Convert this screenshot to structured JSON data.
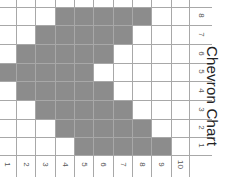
{
  "chart_data": {
    "type": "heatmap",
    "title": "Chevron Chart",
    "orientation_note": "image rotated 90deg clockwise",
    "columns": [
      "1",
      "2",
      "3",
      "4",
      "5",
      "6",
      "7",
      "8",
      "9",
      "10"
    ],
    "rows": [
      "8",
      "7",
      "6",
      "5",
      "4",
      "3",
      "2",
      "1"
    ],
    "filled": {
      "8": [
        4,
        5,
        6,
        7,
        8
      ],
      "7": [
        3,
        4,
        5,
        6,
        7
      ],
      "6": [
        2,
        3,
        4,
        5,
        6
      ],
      "5": [
        1,
        2,
        3,
        4,
        5
      ],
      "4": [
        2,
        3,
        4,
        5,
        6
      ],
      "3": [
        3,
        4,
        5,
        6,
        7
      ],
      "2": [
        4,
        5,
        6,
        7,
        8
      ],
      "1": [
        5,
        6,
        7,
        8,
        9
      ]
    },
    "fill_color": "#8c8c8c",
    "empty_color": "#ffffff",
    "grid": true
  },
  "title": "Chevron Chart",
  "column_labels": [
    "1",
    "2",
    "3",
    "4",
    "5",
    "6",
    "7",
    "8",
    "9",
    "10"
  ],
  "row_labels": [
    "8",
    "7",
    "6",
    "5",
    "4",
    "3",
    "2",
    "1"
  ]
}
